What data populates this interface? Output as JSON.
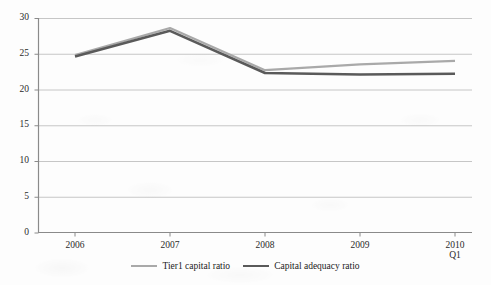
{
  "chart_data": {
    "type": "line",
    "title": "",
    "subtitle": "",
    "xlabel": "",
    "ylabel": "",
    "categories": [
      "2006",
      "2007",
      "2008",
      "2009",
      "2010\nQ1"
    ],
    "x_tick_labels": [
      "2006",
      "2007",
      "2008",
      "2009",
      "2010 Q1"
    ],
    "x_tick_line1": [
      "2006",
      "2007",
      "2008",
      "2009",
      "2010"
    ],
    "x_tick_line2": [
      "",
      "",
      "",
      "",
      "Q1"
    ],
    "series": [
      {
        "name": "Tier1 capital ratio",
        "color": "#a9a9a9",
        "values": [
          24.8,
          28.6,
          22.7,
          23.5,
          24.0
        ]
      },
      {
        "name": "Capital adequacy ratio",
        "color": "#5a5a5a",
        "values": [
          24.6,
          28.2,
          22.3,
          22.1,
          22.2
        ]
      }
    ],
    "ylim": [
      0,
      30
    ],
    "y_ticks": [
      0,
      5,
      10,
      15,
      20,
      25,
      30
    ],
    "y_tick_labels": [
      "0",
      "5",
      "10",
      "15",
      "20",
      "25",
      "30"
    ],
    "grid": "horizontal",
    "grid_color": "#bfbfbf",
    "axis_color": "#808080",
    "legend_position": "bottom-center"
  },
  "legend": {
    "entries": [
      {
        "label": "Tier1 capital ratio"
      },
      {
        "label": "Capital adequacy ratio"
      }
    ]
  }
}
